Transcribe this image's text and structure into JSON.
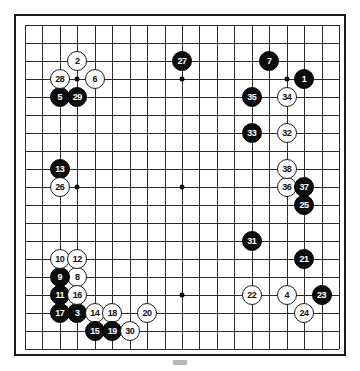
{
  "diagram": {
    "type": "go-game-record",
    "board_size": 19,
    "caption": "",
    "star_points": [
      {
        "col": 3,
        "row": 3
      },
      {
        "col": 9,
        "row": 3
      },
      {
        "col": 15,
        "row": 3
      },
      {
        "col": 3,
        "row": 9
      },
      {
        "col": 9,
        "row": 9
      },
      {
        "col": 15,
        "row": 9
      },
      {
        "col": 3,
        "row": 15
      },
      {
        "col": 9,
        "row": 15
      },
      {
        "col": 15,
        "row": 15
      }
    ],
    "colors": {
      "black_stone": "#0d0d0d",
      "white_stone": "#ffffff",
      "board_line": "#2b2b2b",
      "board_border": "#1a1a1a",
      "background": "#ffffff"
    },
    "moves": [
      {
        "n": "1",
        "color": "black",
        "col": 16,
        "row": 3
      },
      {
        "n": "2",
        "color": "white",
        "col": 3,
        "row": 2
      },
      {
        "n": "3",
        "color": "black",
        "col": 3,
        "row": 16
      },
      {
        "n": "4",
        "color": "white",
        "col": 15,
        "row": 15
      },
      {
        "n": "5",
        "color": "black",
        "col": 2,
        "row": 4
      },
      {
        "n": "6",
        "color": "white",
        "col": 4,
        "row": 3
      },
      {
        "n": "7",
        "color": "black",
        "col": 14,
        "row": 2
      },
      {
        "n": "8",
        "color": "white",
        "col": 3,
        "row": 14
      },
      {
        "n": "9",
        "color": "black",
        "col": 2,
        "row": 14
      },
      {
        "n": "10",
        "color": "white",
        "col": 2,
        "row": 13
      },
      {
        "n": "11",
        "color": "black",
        "col": 2,
        "row": 15
      },
      {
        "n": "12",
        "color": "white",
        "col": 3,
        "row": 13
      },
      {
        "n": "13",
        "color": "black",
        "col": 2,
        "row": 8
      },
      {
        "n": "14",
        "color": "white",
        "col": 4,
        "row": 16
      },
      {
        "n": "15",
        "color": "black",
        "col": 4,
        "row": 17
      },
      {
        "n": "16",
        "color": "white",
        "col": 3,
        "row": 15
      },
      {
        "n": "17",
        "color": "black",
        "col": 2,
        "row": 16
      },
      {
        "n": "18",
        "color": "white",
        "col": 5,
        "row": 16
      },
      {
        "n": "19",
        "color": "black",
        "col": 5,
        "row": 17
      },
      {
        "n": "20",
        "color": "white",
        "col": 7,
        "row": 16
      },
      {
        "n": "21",
        "color": "black",
        "col": 16,
        "row": 13
      },
      {
        "n": "22",
        "color": "white",
        "col": 13,
        "row": 15
      },
      {
        "n": "23",
        "color": "black",
        "col": 17,
        "row": 15
      },
      {
        "n": "24",
        "color": "white",
        "col": 16,
        "row": 16
      },
      {
        "n": "25",
        "color": "black",
        "col": 16,
        "row": 10
      },
      {
        "n": "26",
        "color": "white",
        "col": 2,
        "row": 9
      },
      {
        "n": "27",
        "color": "black",
        "col": 9,
        "row": 2
      },
      {
        "n": "28",
        "color": "white",
        "col": 2,
        "row": 3
      },
      {
        "n": "29",
        "color": "black",
        "col": 3,
        "row": 4
      },
      {
        "n": "30",
        "color": "white",
        "col": 6,
        "row": 17
      },
      {
        "n": "31",
        "color": "black",
        "col": 13,
        "row": 12
      },
      {
        "n": "32",
        "color": "white",
        "col": 15,
        "row": 6
      },
      {
        "n": "33",
        "color": "black",
        "col": 13,
        "row": 6
      },
      {
        "n": "34",
        "color": "white",
        "col": 15,
        "row": 4
      },
      {
        "n": "35",
        "color": "black",
        "col": 13,
        "row": 4
      },
      {
        "n": "36",
        "color": "white",
        "col": 15,
        "row": 9
      },
      {
        "n": "37",
        "color": "black",
        "col": 16,
        "row": 9
      },
      {
        "n": "38",
        "color": "white",
        "col": 15,
        "row": 8
      }
    ]
  }
}
